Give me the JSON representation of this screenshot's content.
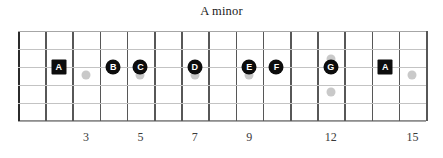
{
  "title": "A minor",
  "chart_data": {
    "type": "diagram",
    "diagram_kind": "guitar-fretboard",
    "title": "A minor",
    "string_count": 6,
    "fret_count": 15,
    "notes": [
      {
        "label": "A",
        "fret": 2,
        "string": 2,
        "shape": "square"
      },
      {
        "label": "B",
        "fret": 4,
        "string": 2,
        "shape": "circle"
      },
      {
        "label": "C",
        "fret": 5,
        "string": 2,
        "shape": "circle"
      },
      {
        "label": "D",
        "fret": 7,
        "string": 2,
        "shape": "circle"
      },
      {
        "label": "E",
        "fret": 9,
        "string": 2,
        "shape": "circle"
      },
      {
        "label": "F",
        "fret": 10,
        "string": 2,
        "shape": "circle"
      },
      {
        "label": "G",
        "fret": 12,
        "string": 2,
        "shape": "circle"
      },
      {
        "label": "A",
        "fret": 14,
        "string": 2,
        "shape": "square"
      }
    ],
    "inlays": [
      {
        "fret": 3,
        "count": 1
      },
      {
        "fret": 5,
        "count": 1
      },
      {
        "fret": 7,
        "count": 1
      },
      {
        "fret": 9,
        "count": 1
      },
      {
        "fret": 12,
        "count": 2
      },
      {
        "fret": 15,
        "count": 1
      }
    ],
    "fret_numbers": [
      {
        "fret": 3,
        "label": "3"
      },
      {
        "fret": 5,
        "label": "5"
      },
      {
        "fret": 7,
        "label": "7"
      },
      {
        "fret": 9,
        "label": "9"
      },
      {
        "fret": 12,
        "label": "12"
      },
      {
        "fret": 15,
        "label": "15"
      }
    ],
    "colors": {
      "note_fill": "#0d0d0d",
      "note_text": "#ffffff",
      "inlay": "#c9c9c9",
      "fret_wire": "#575757",
      "string": "#c3c3c3",
      "nut": "#2b2b2b",
      "background": "#ffffff"
    }
  }
}
